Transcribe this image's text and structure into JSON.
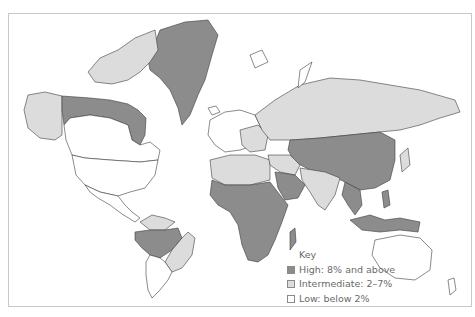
{
  "map": {
    "title": "",
    "colors": {
      "high": "#8c8c8c",
      "intermediate": "#dcdcdc",
      "low": "#ffffff",
      "border": "#3c3c3c",
      "frame": "#c8c8c8"
    }
  },
  "legend": {
    "title": "Key",
    "items": [
      {
        "label": "High: 8% and above",
        "level": "high"
      },
      {
        "label": "Intermediate: 2–7%",
        "level": "intermediate"
      },
      {
        "label": "Low: below 2%",
        "level": "low"
      }
    ]
  },
  "regions": {
    "high": [
      "Greenland",
      "Northern Canada",
      "Amazon basin (Brazil/Peru/Colombia)",
      "Sub-Saharan Africa",
      "Saudi Arabia / Arabian Peninsula",
      "Central Asia",
      "China",
      "Mongolia",
      "Southeast Asia",
      "Indonesia",
      "Papua New Guinea",
      "Philippines"
    ],
    "intermediate": [
      "Alaska",
      "Canadian Arctic Archipelago",
      "Russia",
      "Eastern Europe",
      "North Africa",
      "Middle East",
      "India / South Asia",
      "Eastern Brazil",
      "Northern South America coast",
      "Japan"
    ],
    "low": [
      "Southern Canada",
      "United States",
      "Mexico / Central America",
      "Southern South America",
      "Western Europe",
      "Australia",
      "New Zealand"
    ]
  }
}
